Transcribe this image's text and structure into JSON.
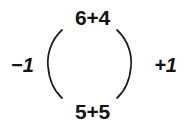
{
  "figure": {
    "background_color": "#ffffff",
    "stroke_color": "#1a1a1a",
    "text_color": "#141414"
  },
  "expressions": {
    "top": "6+4",
    "bottom": "5+5"
  },
  "operators": {
    "left": "−1",
    "right": "+1"
  },
  "arcs": {
    "left_name": "left-parenthesis-arc",
    "right_name": "right-parenthesis-arc"
  }
}
